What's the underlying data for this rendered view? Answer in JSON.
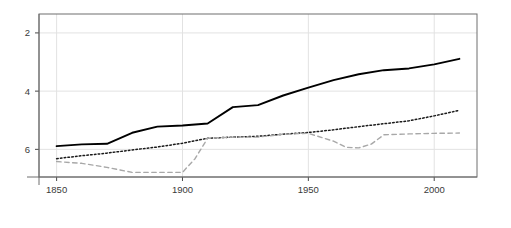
{
  "chart_data": {
    "type": "line",
    "title": "",
    "subtitle": "",
    "xlabel": "",
    "ylabel": "",
    "xlim": [
      1843,
      2017
    ],
    "ylim": [
      6.95,
      1.35
    ],
    "y_axis_inverted": true,
    "grid": true,
    "legend_position": "none",
    "xticks": [
      1850,
      1900,
      1950,
      2000
    ],
    "xtick_labels": [
      "1850",
      "1900",
      "1950",
      "2000"
    ],
    "yticks": [
      2,
      4,
      6
    ],
    "ytick_labels": [
      "2",
      "4",
      "6"
    ],
    "series": [
      {
        "name": "solid-series",
        "style": "solid",
        "color": "#000000",
        "width": 1.9,
        "x": [
          1850,
          1860,
          1870,
          1880,
          1890,
          1900,
          1910,
          1920,
          1930,
          1940,
          1950,
          1960,
          1970,
          1980,
          1990,
          2000,
          2010
        ],
        "values": [
          5.89,
          5.83,
          5.81,
          5.43,
          5.22,
          5.18,
          5.11,
          4.55,
          4.48,
          4.15,
          3.88,
          3.62,
          3.42,
          3.28,
          3.22,
          3.08,
          2.89
        ]
      },
      {
        "name": "dotted-series",
        "style": "dotted",
        "color": "#1a1a1a",
        "width": 1.5,
        "x": [
          1850,
          1860,
          1870,
          1880,
          1890,
          1900,
          1910,
          1920,
          1930,
          1940,
          1950,
          1960,
          1970,
          1980,
          1990,
          2000,
          2010
        ],
        "values": [
          6.32,
          6.22,
          6.13,
          6.02,
          5.92,
          5.79,
          5.62,
          5.58,
          5.55,
          5.48,
          5.42,
          5.33,
          5.22,
          5.12,
          5.02,
          4.85,
          4.66
        ]
      },
      {
        "name": "dashed-series",
        "style": "dashed",
        "color": "#a8a8a8",
        "width": 1.4,
        "x": [
          1850,
          1860,
          1870,
          1880,
          1890,
          1900,
          1905,
          1910,
          1920,
          1930,
          1940,
          1950,
          1960,
          1965,
          1970,
          1975,
          1980,
          1990,
          2000,
          2010
        ],
        "values": [
          6.42,
          6.48,
          6.62,
          6.79,
          6.79,
          6.79,
          6.32,
          5.62,
          5.58,
          5.58,
          5.48,
          5.45,
          5.72,
          5.93,
          5.95,
          5.82,
          5.5,
          5.47,
          5.45,
          5.44
        ]
      }
    ]
  },
  "axes": {
    "plot_frame": {
      "left": 39,
      "top": 14,
      "right": 477,
      "bottom": 177
    }
  }
}
